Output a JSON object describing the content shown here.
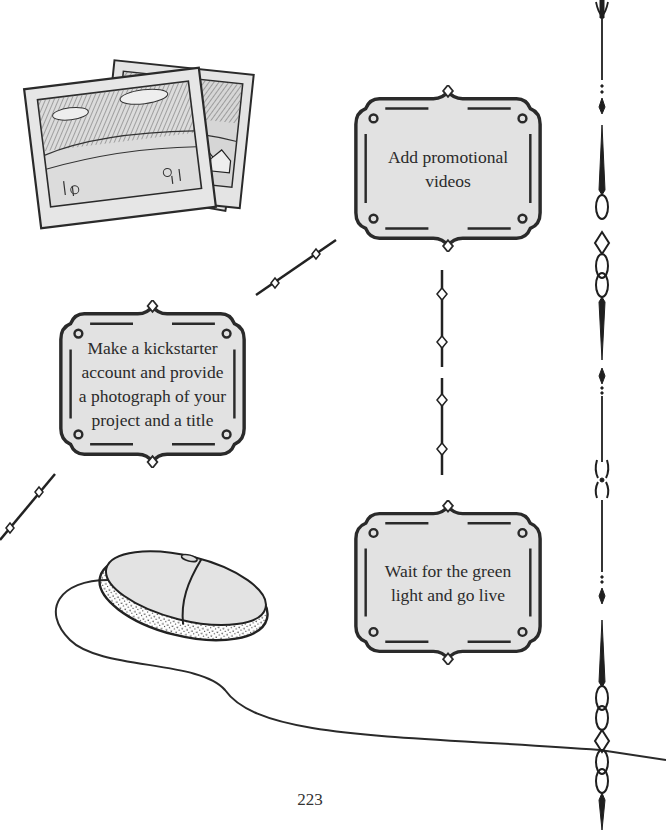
{
  "page": {
    "number": "223",
    "background": "#ffffff",
    "frame_fill": "#e2e2e2",
    "ink_color": "#2a2a2a"
  },
  "steps": [
    {
      "id": "step-1",
      "lines": [
        "Make a kickstarter",
        "account and provide",
        "a photograph of your",
        "project and a title"
      ]
    },
    {
      "id": "step-2",
      "lines": [
        "Add promotional",
        "videos"
      ]
    },
    {
      "id": "step-3",
      "lines": [
        "Wait for the green",
        "light and go live"
      ]
    }
  ],
  "illustrations": {
    "photos": "photographs-illustration",
    "mouse": "computer-mouse-illustration",
    "border": "ornamental-vertical-border"
  }
}
